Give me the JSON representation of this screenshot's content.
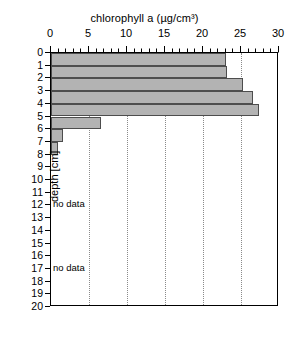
{
  "chart_data": {
    "type": "bar",
    "orientation": "horizontal",
    "title": "chlorophyll a (µg/cm³)",
    "xlabel": "chlorophyll a (µg/cm³)",
    "ylabel": "depth [cm]",
    "xlim": [
      0,
      30
    ],
    "ylim": [
      20,
      0
    ],
    "y_inverted": true,
    "xticks": [
      0,
      5,
      10,
      15,
      20,
      25,
      30
    ],
    "xtick_labels": [
      "0",
      "5",
      "10",
      "15",
      "20",
      "25",
      "30"
    ],
    "x_minor_tick_step": 1,
    "yticks": [
      0,
      1,
      2,
      3,
      4,
      5,
      6,
      7,
      8,
      9,
      10,
      11,
      12,
      13,
      14,
      15,
      16,
      17,
      18,
      19,
      20
    ],
    "ytick_labels": [
      "0",
      "1",
      "2",
      "3",
      "4",
      "5",
      "6",
      "7",
      "8",
      "9",
      "10",
      "11",
      "12",
      "13",
      "14",
      "15",
      "16",
      "17",
      "18",
      "19",
      "20"
    ],
    "grid": {
      "vertical": true,
      "horizontal": false,
      "style": "dotted",
      "at": [
        5,
        10,
        15,
        20,
        25
      ],
      "color": "#8a8a8a"
    },
    "legend": null,
    "bar_color": "#b3b3b3",
    "bar_edge_color": "#4d4d4d",
    "axis_color": "#000000",
    "categories": [
      "0-1",
      "1-2",
      "2-3",
      "3-4",
      "4-5",
      "5-6",
      "6-7",
      "7-8"
    ],
    "bars": [
      {
        "depth_top": 0,
        "depth_bottom": 1,
        "value": 23.0
      },
      {
        "depth_top": 1,
        "depth_bottom": 2,
        "value": 23.2
      },
      {
        "depth_top": 2,
        "depth_bottom": 3,
        "value": 25.3
      },
      {
        "depth_top": 3,
        "depth_bottom": 4,
        "value": 26.6
      },
      {
        "depth_top": 4,
        "depth_bottom": 5,
        "value": 27.4
      },
      {
        "depth_top": 5,
        "depth_bottom": 6,
        "value": 6.6
      },
      {
        "depth_top": 6,
        "depth_bottom": 7,
        "value": 1.6
      },
      {
        "depth_top": 7,
        "depth_bottom": 8,
        "value": 0.9
      }
    ],
    "values": [
      23.0,
      23.2,
      25.3,
      26.6,
      27.4,
      6.6,
      1.6,
      0.9
    ],
    "annotations": [
      {
        "text": "no data",
        "depth": 12
      },
      {
        "text": "no data",
        "depth": 17
      }
    ]
  }
}
